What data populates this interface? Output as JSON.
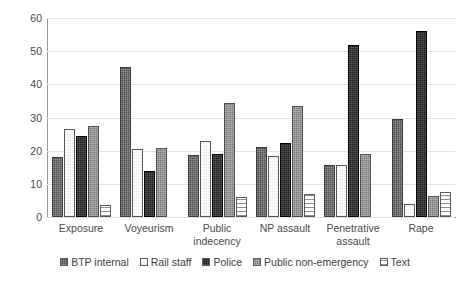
{
  "chart_data": {
    "type": "bar",
    "title": "",
    "xlabel": "",
    "ylabel": "",
    "ylim": [
      0,
      60
    ],
    "yticks": [
      0,
      10,
      20,
      30,
      40,
      50,
      60
    ],
    "grid": true,
    "legend_position": "bottom",
    "categories": [
      "Exposure",
      "Voyeurism",
      "Public indecency",
      "NP assault",
      "Penetrative assault",
      "Rape"
    ],
    "category_lines": [
      [
        "Exposure"
      ],
      [
        "Voyeurism"
      ],
      [
        "Public",
        "indecency"
      ],
      [
        "NP assault"
      ],
      [
        "Penetrative",
        "assault"
      ],
      [
        "Rape"
      ]
    ],
    "series": [
      {
        "name": "BTP internal",
        "values": [
          18.0,
          45.3,
          18.6,
          21.2,
          15.8,
          29.5
        ]
      },
      {
        "name": "Rail staff",
        "values": [
          26.6,
          20.6,
          22.8,
          18.4,
          15.8,
          3.8
        ]
      },
      {
        "name": "Police",
        "values": [
          24.3,
          13.8,
          19.0,
          22.2,
          52.0,
          56.2
        ]
      },
      {
        "name": "Public non-emergency",
        "values": [
          27.5,
          20.7,
          34.5,
          33.6,
          19.0,
          6.2
        ]
      },
      {
        "name": "Text",
        "values": [
          3.5,
          0.0,
          6.1,
          7.0,
          0.0,
          7.6
        ]
      }
    ]
  },
  "legend": {
    "items": [
      {
        "label": "BTP internal"
      },
      {
        "label": "Rail staff"
      },
      {
        "label": "Police"
      },
      {
        "label": "Public non-emergency"
      },
      {
        "label": "Text"
      }
    ]
  }
}
